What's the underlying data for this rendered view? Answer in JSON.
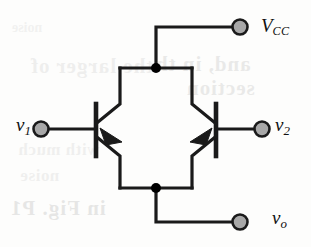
{
  "figure": {
    "type": "circuit-schematic",
    "background_color": "#fdfdfc",
    "wire_color": "#1a1a1a",
    "terminal_fill_color": "#a8a8a8",
    "terminal_stroke_color": "#1a1a1a",
    "junction_color": "#000000"
  },
  "labels": {
    "supply": {
      "symbol": "V",
      "subscript": "CC"
    },
    "input_left": {
      "symbol": "v",
      "subscript": "1"
    },
    "input_right": {
      "symbol": "v",
      "subscript": "2"
    },
    "output": {
      "symbol": "v",
      "subscript": "o"
    }
  },
  "terminals": [
    {
      "name": "vcc-terminal",
      "label": "V_CC",
      "x": 240,
      "y": 27
    },
    {
      "name": "v1-terminal",
      "label": "v_1",
      "x": 41,
      "y": 129
    },
    {
      "name": "v2-terminal",
      "label": "v_2",
      "x": 262,
      "y": 129
    },
    {
      "name": "vo-terminal",
      "label": "v_o",
      "x": 240,
      "y": 222
    }
  ],
  "junctions": [
    {
      "name": "collector-junction",
      "x": 156,
      "y": 68
    },
    {
      "name": "emitter-junction",
      "x": 156,
      "y": 188
    }
  ],
  "transistors": [
    {
      "name": "transistor-q1",
      "type": "NPN",
      "orientation": "left",
      "base_x": 96
    },
    {
      "name": "transistor-q2",
      "type": "NPN",
      "orientation": "right",
      "base_x": 216
    }
  ],
  "ghost_text": {
    "note": "faint bleed-through from the reverse side of the scanned page",
    "lines": [
      "and, in th",
      "section",
      "the larger of",
      "with much",
      "in Fig. P1",
      "noise"
    ]
  }
}
